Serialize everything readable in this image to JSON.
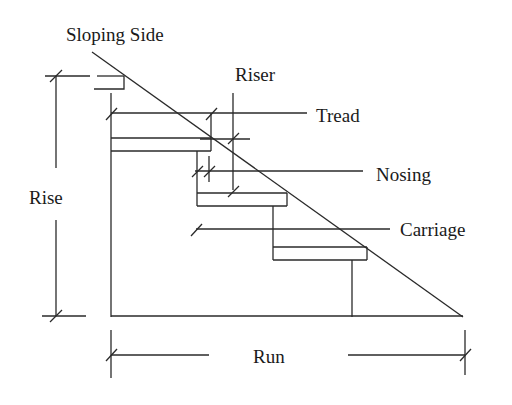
{
  "diagram": {
    "labels": {
      "sloping_side": "Sloping Side",
      "riser": "Riser",
      "tread": "Tread",
      "nosing": "Nosing",
      "carriage": "Carriage",
      "rise": "Rise",
      "run": "Run"
    },
    "colors": {
      "line": "#2a2a2a",
      "text": "#1a1a1a",
      "background": "#ffffff"
    },
    "steps": 3
  }
}
